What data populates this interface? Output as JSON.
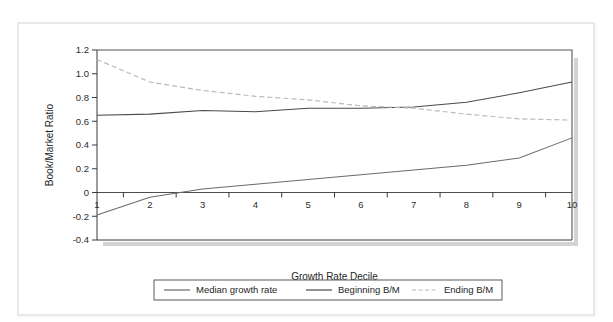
{
  "chart_data": {
    "type": "line",
    "title": "",
    "xlabel": "Growth Rate Decile",
    "ylabel": "Book/Market Ratio",
    "x": [
      1,
      2,
      3,
      4,
      5,
      6,
      7,
      8,
      9,
      10
    ],
    "xtick_labels": [
      "1",
      "2",
      "3",
      "4",
      "5",
      "6",
      "7",
      "8",
      "9",
      "10"
    ],
    "ytick_labels": [
      "1.2",
      "1.0",
      "0.8",
      "0.6",
      "0.4",
      "0.2",
      "0",
      "-0.2",
      "-0.4"
    ],
    "ytick_values": [
      1.2,
      1.0,
      0.8,
      0.6,
      0.4,
      0.2,
      0,
      -0.2,
      -0.4
    ],
    "xlim": [
      1,
      10
    ],
    "ylim": [
      -0.4,
      1.2
    ],
    "grid": false,
    "legend_position": "bottom",
    "zero_line": 0,
    "series": [
      {
        "name": "Median growth rate",
        "style": "solid",
        "color": "#6a6a6a",
        "values": [
          -0.19,
          -0.04,
          0.03,
          0.07,
          0.11,
          0.15,
          0.19,
          0.23,
          0.29,
          0.46
        ]
      },
      {
        "name": "Beginning B/M",
        "style": "solid",
        "color": "#4a4a4a",
        "values": [
          0.65,
          0.66,
          0.69,
          0.68,
          0.71,
          0.71,
          0.72,
          0.76,
          0.84,
          0.93
        ]
      },
      {
        "name": "Ending B/M",
        "style": "dashed",
        "color": "#b9b9b9",
        "values": [
          1.12,
          0.93,
          0.86,
          0.81,
          0.78,
          0.73,
          0.71,
          0.66,
          0.62,
          0.61
        ]
      }
    ]
  },
  "legend": {
    "items": [
      {
        "label": "Median growth rate",
        "style": "solid",
        "color": "#6a6a6a"
      },
      {
        "label": "Beginning B/M",
        "style": "solid",
        "color": "#4a4a4a"
      },
      {
        "label": "Ending B/M",
        "style": "dashed",
        "color": "#b9b9b9"
      }
    ]
  },
  "colors": {
    "background": "#ffffff",
    "card_border": "#e8e8e8",
    "axis": "#3a3a3a",
    "median_growth_rate": "#6a6a6a",
    "beginning_bm": "#4a4a4a",
    "ending_bm": "#b9b9b9"
  }
}
